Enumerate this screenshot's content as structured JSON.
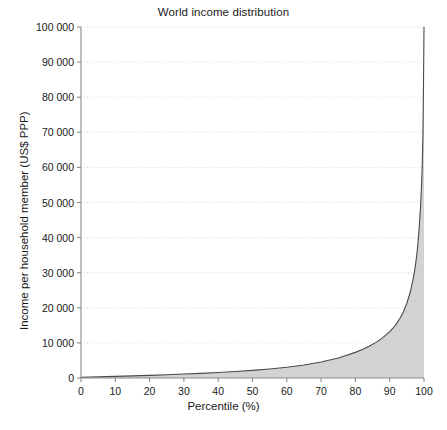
{
  "chart_data": {
    "type": "area",
    "title": "World income distribution",
    "xlabel": "Percentile (%)",
    "ylabel": "Income per household member (US$ PPP)",
    "xlim": [
      0,
      100
    ],
    "ylim": [
      0,
      100000
    ],
    "grid": "horizontal-dotted",
    "legend": null,
    "x_tick_labels": [
      "0",
      "10",
      "20",
      "30",
      "40",
      "50",
      "60",
      "70",
      "80",
      "90",
      "100"
    ],
    "x_tick_values": [
      0,
      10,
      20,
      30,
      40,
      50,
      60,
      70,
      80,
      90,
      100
    ],
    "y_tick_labels": [
      "0",
      "10 000",
      "20 000",
      "30 000",
      "40 000",
      "50 000",
      "60 000",
      "70 000",
      "80 000",
      "90 000",
      "100 000"
    ],
    "y_tick_values": [
      0,
      10000,
      20000,
      30000,
      40000,
      50000,
      60000,
      70000,
      80000,
      90000,
      100000
    ],
    "series": [
      {
        "name": "Income per household member",
        "x": [
          0,
          5,
          10,
          15,
          20,
          25,
          30,
          35,
          40,
          45,
          50,
          55,
          60,
          65,
          70,
          75,
          80,
          82,
          84,
          86,
          88,
          90,
          91,
          92,
          93,
          94,
          95,
          96,
          97,
          97.5,
          98,
          98.5,
          99,
          99.3,
          99.5,
          99.7,
          99.85,
          100
        ],
        "values": [
          200,
          320,
          450,
          600,
          760,
          930,
          1120,
          1330,
          1570,
          1850,
          2180,
          2580,
          3080,
          3720,
          4560,
          5700,
          7300,
          8100,
          9050,
          10150,
          11500,
          13200,
          14250,
          15500,
          17000,
          18900,
          21300,
          24500,
          29000,
          32000,
          36000,
          41500,
          49000,
          55000,
          61000,
          70000,
          83000,
          100000
        ]
      }
    ]
  }
}
